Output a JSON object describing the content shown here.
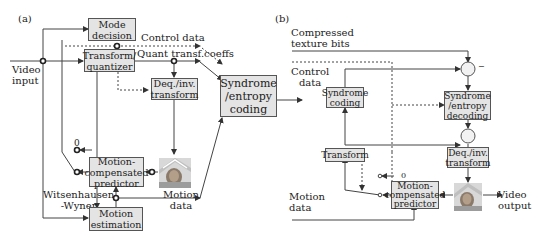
{
  "panel_a": {
    "label": "(a)",
    "boxes": {
      "mode_decision": [
        "Mode",
        "decision"
      ],
      "transform_quantizer": [
        "Transform/",
        "quantizer"
      ],
      "deq_inv_transform": [
        "Deq./inv.",
        "transform"
      ],
      "syndrome_entropy_coding": [
        "Syndrome",
        "/entropy",
        "coding"
      ],
      "motion_compensated_predictor": [
        "Motion-",
        "compensated",
        "predictor"
      ],
      "motion_estimation": [
        "Motion",
        "estimation"
      ]
    },
    "labels": {
      "video_input": [
        "Video",
        "input"
      ],
      "control_data": "Control data",
      "quant_transf_coeffs": "Quant transf.coeffs",
      "zero": "0",
      "witsenhausen_wyner": [
        "Witsenhausen",
        "-Wyner"
      ],
      "motion_data": [
        "Motion",
        "data"
      ]
    }
  },
  "panel_b": {
    "label": "(b)",
    "boxes": {
      "syndrome_coding": [
        "Syndrome",
        "coding"
      ],
      "syndrome_entropy_decoding": [
        "Syndrome",
        "/entropy",
        "decoding"
      ],
      "transform": [
        "Transform"
      ],
      "deq_inv_transform": [
        "Deq./inv.",
        "transform"
      ],
      "motion_compensated_predictor": [
        "Motion-",
        "compensated",
        "predictor"
      ]
    },
    "labels": {
      "compressed_texture_bits": [
        "Compressed",
        "texture bits"
      ],
      "control_data": [
        "Control",
        "data"
      ],
      "minus_sign": "−",
      "zero": "0",
      "motion_data": [
        "Motion",
        "data"
      ],
      "video_output": [
        "Video",
        "output"
      ]
    }
  },
  "colors": {
    "box_fill": "#e4e4e4",
    "box_border": "#555555",
    "line": "#333333"
  }
}
